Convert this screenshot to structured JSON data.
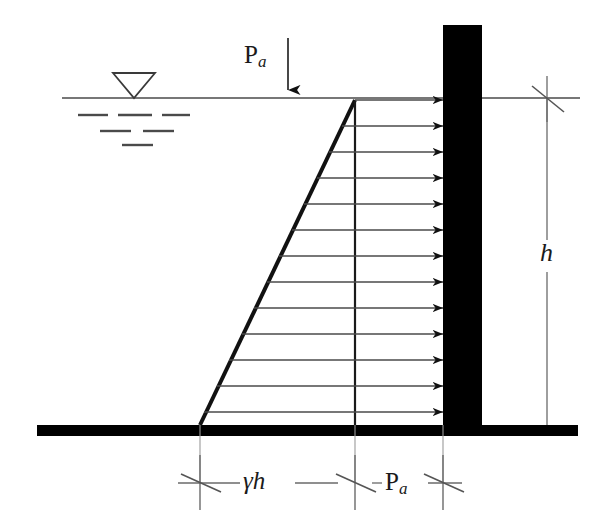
{
  "figure": {
    "type": "engineering-diagram",
    "labels": {
      "surcharge_load": "P",
      "surcharge_load_sub": "a",
      "wall_height": "h",
      "soil_pressure": "γh",
      "surcharge_pressure": "P",
      "surcharge_pressure_sub": "a"
    },
    "colors": {
      "ink": "#1a1a1a",
      "wall_fill": "#000000",
      "ground_fill": "#000000",
      "thin_line": "#555555",
      "background": "#ffffff"
    },
    "geometry": {
      "water_line_y": 98,
      "ground_top_y": 425,
      "ground_bottom_y": 436,
      "ground_left_x": 37,
      "ground_right_x": 578,
      "wall_left_x": 443,
      "wall_right_x": 482,
      "wall_top_y": 25,
      "triangle_apex_x": 355,
      "triangle_apex_y": 100,
      "triangle_base_x": 200,
      "vertical_divider_x": 355,
      "arrow_count": 13,
      "arrow_top_y": 100,
      "arrow_spacing": 26,
      "dim_tick_1_x": 200,
      "dim_tick_2_x": 355,
      "dim_tick_3_x": 443,
      "dim_line_y": 483,
      "h_dim_x": 547,
      "h_dim_top_y": 98,
      "h_dim_bottom_y": 425
    },
    "icons": {
      "water_table": "water-table-triangle-icon",
      "load_arrow": "down-arrow-icon",
      "pressure_arrows": "right-arrow-icon",
      "dimension_tick": "x-tick-icon"
    },
    "water_table_dashes": {
      "row1_count": 3,
      "row2_count": 2,
      "row3_count": 1
    }
  }
}
